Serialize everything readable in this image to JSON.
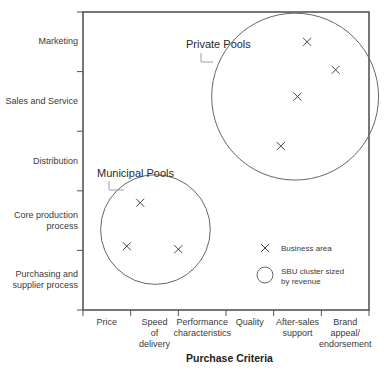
{
  "diagram": {
    "type": "matrix-bubble",
    "x_axis_title": "Purchase Criteria",
    "x_categories": [
      "Price",
      "Speed of delivery",
      "Performance characteristics",
      "Quality",
      "After-sales support",
      "Brand appeal/ endorsement"
    ],
    "x_labels": [
      [
        "Price"
      ],
      [
        "Speed",
        "of",
        "delivery"
      ],
      [
        "Performance",
        "characteristics"
      ],
      [
        "Quality"
      ],
      [
        "After-sales",
        "support"
      ],
      [
        "Brand",
        "appeal/",
        "endorsement"
      ]
    ],
    "y_categories": [
      "Marketing",
      "Sales and Service",
      "Distribution",
      "Core production process",
      "Purchasing and supplier process"
    ],
    "y_labels": [
      [
        "Marketing"
      ],
      [
        "Sales and Service"
      ],
      [
        "Distribution"
      ],
      [
        "Core production",
        "process"
      ],
      [
        "Purchasing and",
        "supplier process"
      ]
    ],
    "clusters": [
      {
        "name": "Private Pools",
        "center": {
          "x": 4.45,
          "y": 1.42
        },
        "radius_units": 1.4,
        "business_areas": [
          {
            "x": 4.7,
            "y": 0.5
          },
          {
            "x": 5.3,
            "y": 0.97
          },
          {
            "x": 4.5,
            "y": 1.42
          },
          {
            "x": 4.15,
            "y": 2.25
          }
        ]
      },
      {
        "name": "Municipal Pools",
        "center": {
          "x": 1.52,
          "y": 3.65
        },
        "radius_units": 0.92,
        "business_areas": [
          {
            "x": 1.2,
            "y": 3.2
          },
          {
            "x": 0.92,
            "y": 3.93
          },
          {
            "x": 2.0,
            "y": 3.98
          }
        ]
      }
    ],
    "legend": {
      "business_area": "Business area",
      "sbu_cluster": [
        "SBU cluster sized",
        "by revenue"
      ]
    },
    "colors": {
      "frame": "#555555",
      "circle": "#666666",
      "mark": "#444444",
      "text": "#333333"
    }
  }
}
